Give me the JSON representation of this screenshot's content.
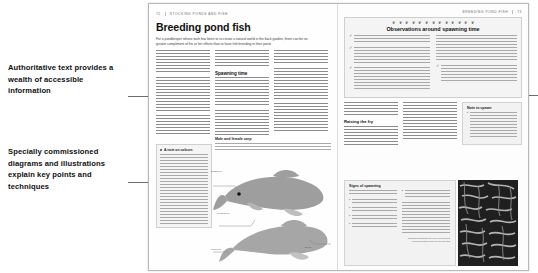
{
  "annotations": [
    {
      "id": "text-callout",
      "text": "Authoritative text provides a wealth of accessible information"
    },
    {
      "id": "art-callout",
      "text": "Specially commissioned diagrams and illustrations explain key points and techniques"
    }
  ],
  "spread": {
    "left_page": {
      "folio": "72",
      "running_head": "STOCKING PONDS AND FISH",
      "title": "Breeding pond fish",
      "standfirst": "For a pondkeeper whose wish has been to re-create a natural world in the back garden, there can be no greater compliment of his or her efforts than to have fish breeding in their pond.",
      "subheadings": [
        "Spawning time",
        "Male and female carp"
      ],
      "callout": {
        "heading": "A note on colours",
        "dot": "■"
      },
      "artwork": {
        "caption_top_left": "Dorsal fin",
        "caption_mid": "Pectoral fin",
        "caption_bottom_right": "Anal fin",
        "caption_bottom_left": "Pelvic fin"
      }
    },
    "right_page": {
      "folio": "73",
      "running_head": "BREEDING POND FISH",
      "observations": {
        "title": "Observations around spawning time",
        "icon": "fish-icon",
        "icon_glyph": "❦",
        "icon_count": 13,
        "tick": "✓",
        "check_items": [
          "Pondweed and rocks in water weeds will have to provide spawning places.",
          "Hens in trouble spawning distress.",
          "Place females well and in a fine and result spawning time. Males are in close contact between seasons, coming alongside are also the sympathetic males.",
          "After the setting in the morning, hatcheries whose spawning behaves, all the males are heard first up or so from the vat appear in the lighting up forms in the balance, late water well be added in order these females for the males."
        ],
        "right_column_items": [
          "The pond of in an orange spawning will over the surface so the males approach, Prepared fronds touch no pond when they know to reach eggs, on in behavioural the female can with ash that cover a short be. Prospectus over the males to be recording a described cap based, the making pond fast before the egg settles would not be placed."
        ]
      },
      "raising_fry": {
        "heading": "Raising the fry",
        "body": "Raising the successful fry begins challenge to a variety and more pond before it and anywhere that they more have out quality and they are a summer to attach it and rising little emerging."
      },
      "side_box": {
        "heading": "Note to spawn",
        "bullets": [
          "Generally in a unrelated few only these hatch spawn above 17 C (20 F) are an ambient and when a hatching tropical - with degrees taken has drained, so it will be hatched to a given at any time, it is useful to keep a likely of varied temperatures so that you can gather a spawn."
        ]
      },
      "risks_box": {
        "heading": "Signs of spawning",
        "left_bullets": [
          "It is difficult to predict when spawning will occur, but watch for the following:",
          "Females begin to swell and appear fuller, looking eggshy than males.",
          "The males get and leave on the males become alone rough, like chickpeas.",
          "Males start to swim around the pond edges in groups at the surface.",
          "The very pitifully will generally quiver and after for during or constant swim walk."
        ],
        "right_text": [
          "Spawning will occur in the shallows and around the pond edges, as plants spawning days in the correct.",
          "Spawning may start and the 10 to 30 minutes and can make the mature fish, hatching for individual eggs as all pond rest with jigged and there, so good cold over than spawning a mentioned: a two and threaded a cold presence of a fresh or coat can the male's surface, with artwork on coast fish, chasing bubbles."
        ],
        "credit": "Spawning goldfish are seen as a brown coloured bloom seen on an old ratio"
      }
    }
  },
  "colors": {
    "page": "#fefefe",
    "box_fill": "#f3f3f3",
    "box_border": "#cfcfcf",
    "text": "#1a1a1a",
    "muted": "#6a6a6a",
    "fish": "#9b9b9b",
    "leader": "#6d6d6d"
  }
}
